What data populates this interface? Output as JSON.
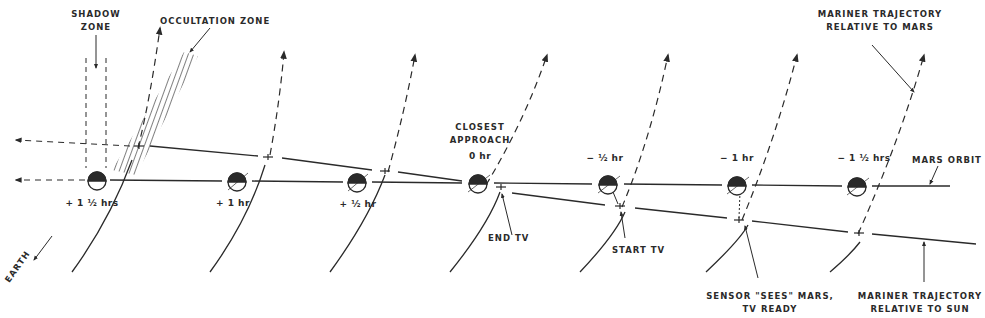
{
  "labels": {
    "shadow_zone_line1": "SHADOW",
    "shadow_zone_line2": "ZONE",
    "occultation_zone": "OCCULTATION ZONE",
    "mariner_mars_line1": "MARINER TRAJECTORY",
    "mariner_mars_line2": "RELATIVE TO MARS",
    "closest_line1": "CLOSEST",
    "closest_line2": "APPROACH",
    "closest_time": "0 hr",
    "mars_orbit": "MARS ORBIT",
    "end_tv": "END TV",
    "start_tv": "START TV",
    "sensor_line1": "SENSOR \"SEES\" MARS,",
    "sensor_line2": "TV READY",
    "mariner_sun_line1": "MARINER TRAJECTORY",
    "mariner_sun_line2": "RELATIVE TO SUN",
    "earth": "EARTH"
  },
  "positions": [
    {
      "time": "+ 1 ½ hrs",
      "x": 97
    },
    {
      "time": "+ 1 hr",
      "x": 237
    },
    {
      "time": "+ ½ hr",
      "x": 357
    },
    {
      "time": "0 hr",
      "x": 478
    },
    {
      "time": "− ½ hr",
      "x": 608
    },
    {
      "time": "− 1 hr",
      "x": 737
    },
    {
      "time": "− 1 ½ hrs",
      "x": 857
    }
  ],
  "colors": {
    "ink": "#2a2a2a",
    "background": "#ffffff"
  }
}
